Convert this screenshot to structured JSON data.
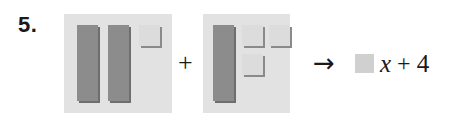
{
  "problem": {
    "number_label": "5.",
    "type": "algebra-tiles-addition"
  },
  "panels": [
    {
      "name": "first-addend",
      "x_tile_count": 2,
      "unit_tile_count": 1,
      "expression": "2x + 1"
    },
    {
      "name": "second-addend",
      "x_tile_count": 1,
      "unit_tile_count": 3,
      "expression": "x + 3"
    }
  ],
  "operators": {
    "plus": "+",
    "arrow": "→"
  },
  "result": {
    "blank_label": "",
    "variable": "x",
    "plus": "+",
    "constant": "4",
    "full_text": "x + 4"
  },
  "colors": {
    "panel_background": "#e2e2e2",
    "x_tile": "#8c8c8c",
    "x_tile_shadow": "#6e6e6e",
    "unit_tile": "#dcdcdc",
    "unit_tile_shadow": "#8a8a8a",
    "blank_tile": "#d0d0d0",
    "text": "#1a1a1a",
    "page_background": "#ffffff"
  }
}
